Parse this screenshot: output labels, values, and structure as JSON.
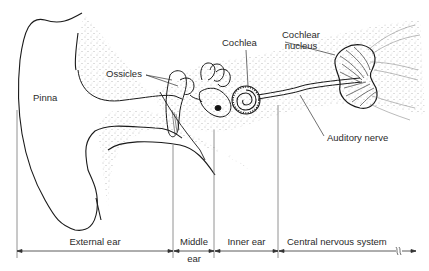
{
  "diagram": {
    "structures": {
      "pinna": "Pinna",
      "ossicles": "Ossicles",
      "cochlea": "Cochlea",
      "cochlear_nucleus_line1": "Cochlear",
      "cochlear_nucleus_line2": "nucleus",
      "auditory_nerve": "Auditory nerve"
    },
    "regions": [
      {
        "label": "External ear"
      },
      {
        "label_line1": "Middle",
        "label_line2": "ear"
      },
      {
        "label": "Inner ear"
      },
      {
        "label": "Central nervous system"
      }
    ],
    "colors": {
      "line": "#1a1a1a",
      "stipple": "#555555",
      "background": "#ffffff"
    }
  }
}
